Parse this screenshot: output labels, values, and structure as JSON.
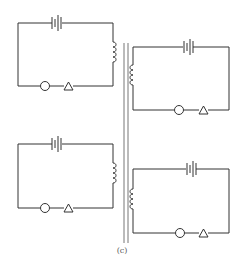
{
  "figure": {
    "caption": "(c)"
  },
  "colors": {
    "line": "#333333",
    "background": "#ffffff"
  },
  "circuits": [
    {
      "id": "top-left",
      "components": [
        "battery",
        "coil",
        "lamp",
        "switch"
      ]
    },
    {
      "id": "top-right",
      "components": [
        "battery",
        "coil",
        "lamp",
        "switch"
      ]
    },
    {
      "id": "bottom-left",
      "components": [
        "battery",
        "coil",
        "lamp",
        "switch"
      ]
    },
    {
      "id": "bottom-right",
      "components": [
        "battery",
        "coil",
        "lamp",
        "switch"
      ]
    }
  ]
}
